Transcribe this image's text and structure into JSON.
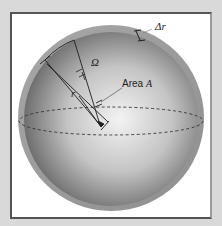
{
  "diagram": {
    "type": "spherical-shell-solid-angle",
    "labels": {
      "delta_r": "Δr",
      "omega": "Ω",
      "radius": "r",
      "area_prefix": "Area ",
      "area_var": "A"
    },
    "colors": {
      "background": "#d9d9d9",
      "frame": "#ffffff",
      "shell": "#9e9e9e",
      "sphere_center": "#f2f2f2",
      "sphere_edge": "#6b6b6b",
      "lines": "#222222"
    }
  }
}
